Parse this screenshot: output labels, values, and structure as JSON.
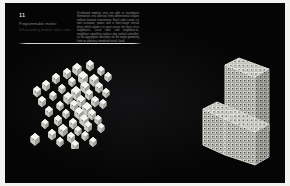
{
  "slide": {
    "number": "11",
    "subtitle": "Programmable matter",
    "caption": "Self-assembling modular robotic cubes",
    "body_text": "Distributed modular units are able to reconfigure themselves into arbitrary three-dimensional shapes without external intervention. Each cube carries its own actuation, power and a short-range inertial drive, which allows it to pivot across the faces of its neighbours. Local rules and neighbour-to-neighbour signalling replace any central controller, so the aggregate converges on the target geometry from an arbitrary unordered initial cloud.",
    "background_color": "#050505",
    "page_color": "#f2f2f0",
    "rule_color": "#e1e1de",
    "text_color": "#9a9a98"
  },
  "figures": [
    {
      "id": "scatter",
      "name": "unordered-cube-cloud",
      "label": "Disordered cube cloud",
      "cube_color": "#e9e9e6",
      "cube_count": 46,
      "cubes": [
        {
          "x": 62,
          "y": 12,
          "s": 9
        },
        {
          "x": 75,
          "y": 9,
          "s": 8
        },
        {
          "x": 52,
          "y": 17,
          "s": 8
        },
        {
          "x": 86,
          "y": 15,
          "s": 7
        },
        {
          "x": 68,
          "y": 20,
          "s": 10
        },
        {
          "x": 41,
          "y": 22,
          "s": 8
        },
        {
          "x": 79,
          "y": 23,
          "s": 9
        },
        {
          "x": 57,
          "y": 26,
          "s": 7
        },
        {
          "x": 93,
          "y": 21,
          "s": 7
        },
        {
          "x": 70,
          "y": 30,
          "s": 9
        },
        {
          "x": 31,
          "y": 29,
          "s": 8
        },
        {
          "x": 84,
          "y": 31,
          "s": 8
        },
        {
          "x": 47,
          "y": 33,
          "s": 7
        },
        {
          "x": 61,
          "y": 35,
          "s": 10
        },
        {
          "x": 74,
          "y": 38,
          "s": 8
        },
        {
          "x": 22,
          "y": 35,
          "s": 8
        },
        {
          "x": 91,
          "y": 37,
          "s": 7
        },
        {
          "x": 53,
          "y": 41,
          "s": 9
        },
        {
          "x": 66,
          "y": 44,
          "s": 9
        },
        {
          "x": 38,
          "y": 40,
          "s": 7
        },
        {
          "x": 80,
          "y": 45,
          "s": 8
        },
        {
          "x": 27,
          "y": 45,
          "s": 8
        },
        {
          "x": 59,
          "y": 49,
          "s": 8
        },
        {
          "x": 72,
          "y": 51,
          "s": 10
        },
        {
          "x": 45,
          "y": 50,
          "s": 7
        },
        {
          "x": 88,
          "y": 48,
          "s": 7
        },
        {
          "x": 64,
          "y": 56,
          "s": 9
        },
        {
          "x": 34,
          "y": 55,
          "s": 8
        },
        {
          "x": 77,
          "y": 58,
          "s": 8
        },
        {
          "x": 51,
          "y": 58,
          "s": 7
        },
        {
          "x": 69,
          "y": 63,
          "s": 9
        },
        {
          "x": 43,
          "y": 64,
          "s": 8
        },
        {
          "x": 83,
          "y": 64,
          "s": 7
        },
        {
          "x": 58,
          "y": 67,
          "s": 8
        },
        {
          "x": 30,
          "y": 68,
          "s": 7
        },
        {
          "x": 73,
          "y": 70,
          "s": 8
        },
        {
          "x": 48,
          "y": 73,
          "s": 9
        },
        {
          "x": 63,
          "y": 75,
          "s": 7
        },
        {
          "x": 86,
          "y": 72,
          "s": 7
        },
        {
          "x": 37,
          "y": 78,
          "s": 8
        },
        {
          "x": 56,
          "y": 81,
          "s": 8
        },
        {
          "x": 70,
          "y": 80,
          "s": 7
        },
        {
          "x": 20,
          "y": 82,
          "s": 9
        },
        {
          "x": 45,
          "y": 86,
          "s": 7
        },
        {
          "x": 78,
          "y": 86,
          "s": 7
        },
        {
          "x": 60,
          "y": 89,
          "s": 8
        }
      ]
    },
    {
      "id": "chair",
      "name": "assembled-chair-structure",
      "label": "Assembled chair",
      "cube_color": "#dededa",
      "face_shading": {
        "top": "#f0f0ec",
        "left": "#c7c7c2",
        "right": "#a9a9a4"
      },
      "grid": {
        "back_cols": 9,
        "back_rows": 12,
        "seat_cols": 9,
        "seat_rows": 5
      }
    }
  ],
  "icons": {
    "corner_marker": "corner-marker-icon"
  }
}
